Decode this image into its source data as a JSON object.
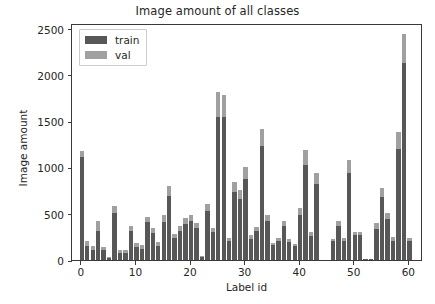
{
  "chart_data": {
    "type": "bar",
    "stacked": true,
    "title": "Image amount of all classes",
    "xlabel": "Label id",
    "ylabel": "Image amount",
    "xlim": [
      -1.8,
      62.5
    ],
    "ylim": [
      0,
      2560
    ],
    "yticks": [
      0,
      500,
      1000,
      1500,
      2000,
      2500
    ],
    "xticks": [
      0,
      10,
      20,
      30,
      40,
      50,
      60
    ],
    "grid": false,
    "legend_position": "upper left",
    "legend": [
      "train",
      "val"
    ],
    "colors": {
      "train": "#575757",
      "val": "#a0a0a0",
      "axis": "#3a3a3a",
      "text": "#262626"
    },
    "categories": [
      0,
      1,
      2,
      3,
      4,
      5,
      6,
      7,
      8,
      9,
      10,
      11,
      12,
      13,
      14,
      15,
      16,
      17,
      18,
      19,
      20,
      21,
      22,
      23,
      24,
      25,
      26,
      27,
      28,
      29,
      30,
      31,
      32,
      33,
      34,
      35,
      36,
      37,
      38,
      39,
      40,
      41,
      42,
      43,
      46,
      47,
      48,
      49,
      50,
      51,
      52,
      53,
      54,
      55,
      56,
      57,
      58,
      59,
      60
    ],
    "series": [
      {
        "name": "train",
        "values": [
          1175,
          205,
          150,
          420,
          140,
          30,
          585,
          105,
          105,
          365,
          185,
          160,
          470,
          345,
          200,
          485,
          800,
          280,
          365,
          450,
          490,
          405,
          45,
          610,
          350,
          1810,
          1785,
          240,
          840,
          760,
          1005,
          270,
          360,
          1410,
          490,
          185,
          240,
          425,
          225,
          175,
          560,
          1185,
          300,
          945,
          230,
          420,
          240,
          1080,
          305,
          305,
          15,
          10,
          395,
          780,
          510,
          245,
          1385,
          2440,
          235
        ]
      },
      {
        "name": "val",
        "values": [
          60,
          55,
          40,
          110,
          35,
          8,
          80,
          28,
          28,
          50,
          48,
          40,
          60,
          50,
          50,
          70,
          110,
          40,
          50,
          60,
          70,
          55,
          12,
          80,
          48,
          265,
          245,
          35,
          110,
          100,
          130,
          38,
          50,
          175,
          65,
          25,
          35,
          60,
          30,
          25,
          75,
          155,
          40,
          125,
          30,
          55,
          35,
          140,
          40,
          40,
          5,
          4,
          55,
          100,
          70,
          35,
          190,
          310,
          32
        ]
      }
    ]
  }
}
